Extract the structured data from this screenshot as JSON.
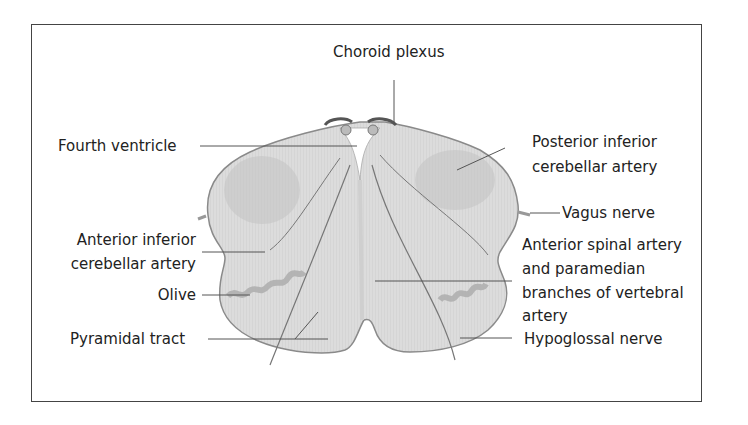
{
  "labels": {
    "choroid_plexus": "Choroid plexus",
    "fourth_ventricle": "Fourth ventricle",
    "posterior_inferior_cerebellar_artery": [
      "Posterior inferior",
      "cerebellar artery"
    ],
    "vagus_nerve": "Vagus nerve",
    "anterior_inferior_cerebellar_artery": [
      "Anterior inferior",
      "cerebellar artery"
    ],
    "anterior_spinal_artery": [
      "Anterior spinal artery",
      "and paramedian",
      "branches of vertebral",
      "artery"
    ],
    "olive": "Olive",
    "pyramidal_tract": "Pyramidal tract",
    "hypoglossal_nerve": "Hypoglossal nerve"
  },
  "colors": {
    "tissue": "#d9d9d9",
    "tissue_dark": "#bdbdbd",
    "outline": "#666666",
    "leader_line": "#555555",
    "text": "#222222",
    "border": "#444444"
  }
}
